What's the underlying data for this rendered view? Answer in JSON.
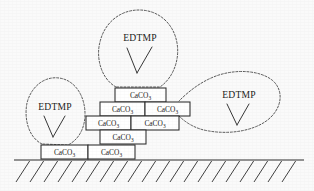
{
  "figure": {
    "background_color": "#fafafa",
    "line_color": "#2b2b2b",
    "width": 314,
    "height": 191
  },
  "labels": {
    "scale_formula_prefix": "CaCO",
    "scale_formula_subscript": "3",
    "inhibitor": "EDTMP"
  },
  "bricks": [
    {
      "id": "brick-r1-c1",
      "row": 1,
      "col": 1,
      "x": 115,
      "y": 88,
      "w": 51,
      "h": 14,
      "label_prefix": "CaCO",
      "label_sub": "3"
    },
    {
      "id": "brick-r2-c1",
      "row": 2,
      "col": 1,
      "x": 100,
      "y": 102,
      "w": 45,
      "h": 14,
      "label_prefix": "CaCO",
      "label_sub": "3"
    },
    {
      "id": "brick-r2-c2",
      "row": 2,
      "col": 2,
      "x": 145,
      "y": 102,
      "w": 45,
      "h": 14,
      "label_prefix": "CaCO",
      "label_sub": "3"
    },
    {
      "id": "brick-r3-c1",
      "row": 3,
      "col": 1,
      "x": 86,
      "y": 116,
      "w": 45,
      "h": 14,
      "label_prefix": "CaCO",
      "label_sub": "3"
    },
    {
      "id": "brick-r3-c2",
      "row": 3,
      "col": 2,
      "x": 131,
      "y": 116,
      "w": 48,
      "h": 14,
      "label_prefix": "CaCO",
      "label_sub": "3"
    },
    {
      "id": "brick-r4-c1",
      "row": 4,
      "col": 1,
      "x": 100,
      "y": 130,
      "w": 46,
      "h": 14,
      "label_prefix": "CaCO",
      "label_sub": "3"
    },
    {
      "id": "brick-r5-c1",
      "row": 5,
      "col": 1,
      "x": 41,
      "y": 145,
      "w": 47,
      "h": 14,
      "label_prefix": "CaCO",
      "label_sub": "3"
    },
    {
      "id": "brick-r5-c2",
      "row": 5,
      "col": 2,
      "x": 88,
      "y": 145,
      "w": 47,
      "h": 14,
      "label_prefix": "CaCO",
      "label_sub": "3"
    }
  ],
  "blobs": [
    {
      "id": "blob-top",
      "name": "edtmp-blob-top",
      "label": "EDTMP",
      "label_x": 140,
      "label_y": 39,
      "vee": {
        "ax": 127,
        "ay": 48,
        "bx": 137,
        "by": 73,
        "cx": 152,
        "cy": 47
      },
      "path": "M 116 87 C 100 78 96 56 100 42 C 104 24 119 10 139 10 C 160 10 174 25 177 43 C 180 60 173 78 160 87 Z"
    },
    {
      "id": "blob-left",
      "name": "edtmp-blob-left",
      "label": "EDTMP",
      "label_x": 55,
      "label_y": 108,
      "vee": {
        "ax": 44,
        "ay": 116,
        "bx": 53,
        "by": 137,
        "cx": 65,
        "cy": 116
      },
      "path": "M 42 144 C 28 137 24 118 27 103 C 31 87 44 76 59 78 C 75 80 85 96 85 114 C 85 129 78 140 68 145 Z"
    },
    {
      "id": "blob-right",
      "name": "edtmp-blob-right",
      "label": "EDTMP",
      "label_x": 239,
      "label_y": 96,
      "vee": {
        "ax": 227,
        "ay": 104,
        "bx": 237,
        "by": 125,
        "cx": 249,
        "cy": 104
      },
      "path": "M 179 116 C 185 122 195 129 209 131 C 232 135 258 130 271 117 C 283 105 283 89 272 80 C 259 70 235 69 216 76 C 200 82 188 92 179 101"
    }
  ],
  "ground": {
    "name": "substrate-surface",
    "line_y": 160,
    "x_start": 14,
    "x_end": 304,
    "hatch_count": 20,
    "hatch_length": 22,
    "hatch_dx": 14
  }
}
